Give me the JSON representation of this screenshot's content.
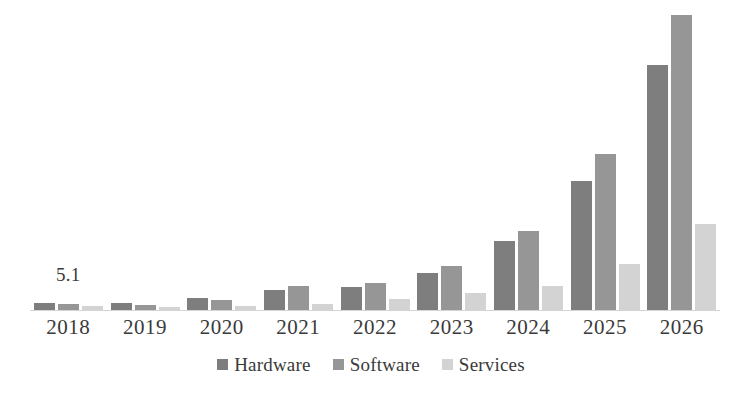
{
  "chart_data": {
    "type": "bar",
    "title": "",
    "subtitle": "",
    "xlabel": "",
    "ylabel": "",
    "grid": false,
    "legend_position": "bottom",
    "axis_visible": {
      "x": true,
      "y": false
    },
    "ylim": [
      0,
      92
    ],
    "categories": [
      "2018",
      "2019",
      "2020",
      "2021",
      "2022",
      "2023",
      "2024",
      "2025",
      "2026"
    ],
    "series": [
      {
        "name": "Hardware",
        "color": "#7e7e7e",
        "values": [
          2.1,
          2.2,
          3.6,
          6.1,
          7.0,
          11.3,
          21.0,
          39.3,
          74.7
        ]
      },
      {
        "name": "Software",
        "color": "#969696",
        "values": [
          1.8,
          1.5,
          3.2,
          7.3,
          8.2,
          13.4,
          24.1,
          47.6,
          90.0
        ]
      },
      {
        "name": "Services",
        "color": "#d3d3d3",
        "values": [
          1.2,
          0.9,
          1.2,
          1.8,
          3.4,
          5.2,
          7.3,
          14.0,
          26.2
        ]
      }
    ],
    "annotations": [
      {
        "text": "5.1",
        "category": "2018",
        "kind": "data-label"
      }
    ]
  },
  "legend": {
    "items": [
      {
        "label": "Hardware",
        "color": "#7e7e7e"
      },
      {
        "label": "Software",
        "color": "#969696"
      },
      {
        "label": "Services",
        "color": "#d3d3d3"
      }
    ]
  },
  "colors": {
    "hardware": "#7e7e7e",
    "software": "#969696",
    "services": "#d3d3d3",
    "axis": "#d4d4d4",
    "text": "#3a3a3a",
    "background": "#ffffff"
  }
}
